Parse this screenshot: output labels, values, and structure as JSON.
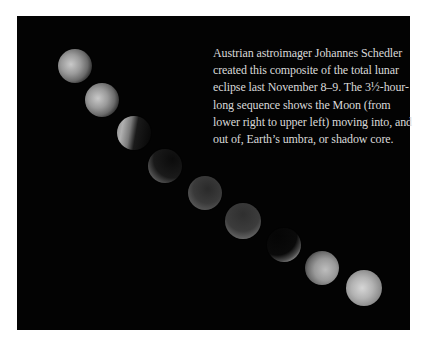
{
  "figure": {
    "background_color": "#030303",
    "caption_lines": [
      "Austrian astroimager Johannes Schedler",
      "created this composite of the total lunar",
      "eclipse last November 8–9. The 3½-hour-",
      "long sequence shows the Moon (from",
      "lower right to upper left) moving into, and",
      "out of, Earth’s umbra, or shadow core."
    ],
    "caption_color": "#d9d9d9"
  },
  "moons": [
    {
      "cx": 75,
      "cy": 66,
      "r": 17,
      "phase": "partial-lit-left"
    },
    {
      "cx": 102,
      "cy": 100,
      "r": 17,
      "phase": "partial-lit-left"
    },
    {
      "cx": 134,
      "cy": 133,
      "r": 17,
      "phase": "crescent-left"
    },
    {
      "cx": 165,
      "cy": 166,
      "r": 17,
      "phase": "thin-crescent-lower-left"
    },
    {
      "cx": 205,
      "cy": 193,
      "r": 17,
      "phase": "umbral-rim-lower-left"
    },
    {
      "cx": 243,
      "cy": 221,
      "r": 18,
      "phase": "umbral-rim-bottom"
    },
    {
      "cx": 284,
      "cy": 245,
      "r": 17,
      "phase": "crescent-lower-right"
    },
    {
      "cx": 322,
      "cy": 268,
      "r": 17,
      "phase": "partial-lit-right"
    },
    {
      "cx": 364,
      "cy": 288,
      "r": 18,
      "phase": "nearly-full"
    }
  ]
}
